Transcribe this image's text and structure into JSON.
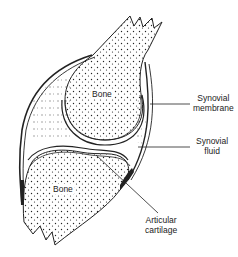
{
  "diagram": {
    "parts": {
      "upper_bone": {
        "label": "Bone"
      },
      "lower_bone": {
        "label": "Bone"
      }
    },
    "callouts": [
      {
        "id": "synovial-membrane",
        "line1": "Synovial",
        "line2": "membrane"
      },
      {
        "id": "synovial-fluid",
        "line1": "Synovial",
        "line2": "fluid"
      },
      {
        "id": "articular-cartilage",
        "line1": "Articular",
        "line2": "cartilage"
      }
    ],
    "colors": {
      "ink": "#222222",
      "background": "#ffffff"
    }
  }
}
